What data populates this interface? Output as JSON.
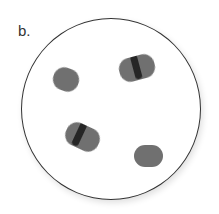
{
  "figure": {
    "label": "b.",
    "cells": [
      {
        "type": "single",
        "x": 53,
        "y": 68,
        "rot": 20
      },
      {
        "type": "dividing",
        "x": 120,
        "y": 56,
        "rot": -15
      },
      {
        "type": "dividing",
        "x": 66,
        "y": 126,
        "rot": 25
      },
      {
        "type": "single",
        "x": 134,
        "y": 144,
        "rot": 0
      }
    ],
    "color": "#707070",
    "band_color": "#262626"
  }
}
